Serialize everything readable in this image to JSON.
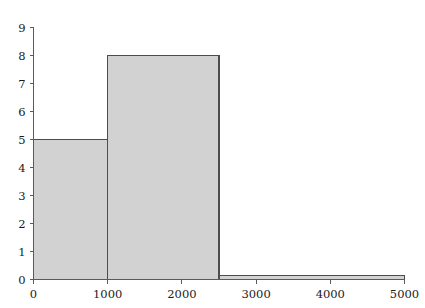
{
  "chart_data": {
    "type": "bar",
    "title": "",
    "subtitle": "",
    "xlabel": "",
    "ylabel": "",
    "grid": false,
    "legend": false,
    "xlim": [
      0,
      5000
    ],
    "ylim": [
      0,
      9
    ],
    "xticks": [
      0,
      1000,
      2000,
      3000,
      4000,
      5000
    ],
    "xtick_labels": [
      "0",
      "1000",
      "2000",
      "3000",
      "4000",
      "5000"
    ],
    "yticks": [
      0,
      1,
      2,
      3,
      4,
      5,
      6,
      7,
      8,
      9
    ],
    "ytick_labels": [
      "0",
      "1",
      "2",
      "3",
      "4",
      "5",
      "6",
      "7",
      "8",
      "9"
    ],
    "bin_edges": [
      0,
      1000,
      2500,
      5000
    ],
    "categories": [
      "0-1000",
      "1000-2500",
      "2500-5000"
    ],
    "values": [
      5,
      8,
      0
    ],
    "bars": [
      {
        "x0": 0,
        "x1": 1000,
        "height": 5
      },
      {
        "x0": 1000,
        "x1": 2500,
        "height": 8
      },
      {
        "x0": 2500,
        "x1": 5000,
        "height": 0
      }
    ],
    "colors": {
      "bar_fill": "#d2d2d2",
      "bar_edge": "#4d4d4d",
      "axis": "#5a5a5a",
      "text": "#1a1a1a",
      "background": "#ffffff"
    }
  }
}
